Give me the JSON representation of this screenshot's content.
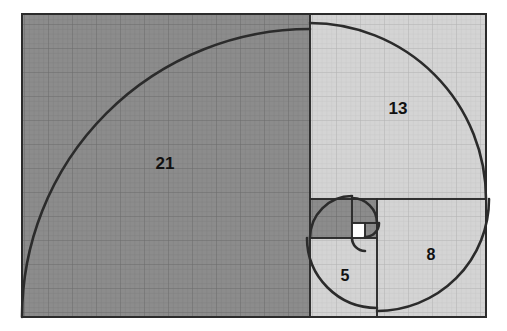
{
  "figure": {
    "kind": "fibonacci-spiral-diagram",
    "background_color": "#ffffff",
    "canvas": {
      "width": 507,
      "height": 331
    },
    "bounds": {
      "x": 22,
      "y": 14,
      "width": 464,
      "height": 303
    },
    "stroke_color": "#2b2b2b",
    "grid_color_dark": "#6f6f6f",
    "grid_color_light": "#b9b9b9",
    "fill_dark": "#8c8c8c",
    "fill_light": "#d4d4d4",
    "fill_white": "#ffffff",
    "border_color": "#2b2b2b",
    "spiral_stroke_width": 2.6,
    "square_stroke_width": 1.6
  },
  "chart_data": {
    "type": "diagram",
    "sequence": [
      1,
      1,
      2,
      3,
      5,
      8,
      13,
      21
    ],
    "labels_shown": [
      "21",
      "13",
      "8",
      "5"
    ],
    "squares": [
      {
        "value": 21,
        "label": "21",
        "label_visible": true,
        "shade": "dark",
        "fill": "#8c8c8c",
        "x": 22,
        "y": 14,
        "size_w": 288,
        "size_h": 303,
        "label_x": 165,
        "label_y": 165,
        "arc": {
          "cx": 310,
          "cy": 317,
          "r": 288,
          "start_deg": 180,
          "sweep_deg": 90
        }
      },
      {
        "value": 13,
        "label": "13",
        "label_visible": true,
        "shade": "light",
        "fill": "#d4d4d4",
        "x": 310,
        "y": 14,
        "size_w": 176,
        "size_h": 185,
        "label_x": 398,
        "label_y": 110,
        "arc": {
          "cx": 310,
          "cy": 199,
          "r": 176,
          "start_deg": 270,
          "sweep_deg": 90
        }
      },
      {
        "value": 8,
        "label": "8",
        "label_visible": true,
        "shade": "light",
        "fill": "#d4d4d4",
        "x": 377,
        "y": 199,
        "size_w": 109,
        "size_h": 118,
        "label_x": 431,
        "label_y": 256,
        "arc": {
          "cx": 377,
          "cy": 199,
          "r": 112,
          "start_deg": 0,
          "sweep_deg": 90
        }
      },
      {
        "value": 5,
        "label": "5",
        "label_visible": true,
        "shade": "light",
        "fill": "#d4d4d4",
        "x": 310,
        "y": 238,
        "size_w": 67,
        "size_h": 79,
        "label_x": 345,
        "label_y": 277,
        "arc": {
          "cx": 377,
          "cy": 238,
          "r": 70,
          "start_deg": 90,
          "sweep_deg": 90
        }
      },
      {
        "value": 3,
        "label": "3",
        "label_visible": false,
        "shade": "dark",
        "fill": "#8c8c8c",
        "x": 310,
        "y": 199,
        "size_w": 42,
        "size_h": 39,
        "label_x": 331,
        "label_y": 219,
        "arc": {
          "cx": 352,
          "cy": 238,
          "r": 42,
          "start_deg": 180,
          "sweep_deg": 90
        }
      },
      {
        "value": 2,
        "label": "2",
        "label_visible": false,
        "shade": "dark",
        "fill": "#8c8c8c",
        "x": 352,
        "y": 199,
        "size_w": 25,
        "size_h": 24,
        "label_x": 364,
        "label_y": 211,
        "arc": {
          "cx": 352,
          "cy": 223,
          "r": 25,
          "start_deg": 270,
          "sweep_deg": 90
        }
      },
      {
        "value": 1,
        "label": "1",
        "label_visible": false,
        "shade": "dark",
        "fill": "#8c8c8c",
        "x": 365,
        "y": 223,
        "size_w": 12,
        "size_h": 15,
        "label_x": 371,
        "label_y": 230,
        "arc": {
          "cx": 365,
          "cy": 223,
          "r": 14,
          "start_deg": 0,
          "sweep_deg": 90
        }
      },
      {
        "value": 1,
        "label": "1",
        "label_visible": false,
        "shade": "white",
        "fill": "#ffffff",
        "x": 352,
        "y": 223,
        "size_w": 13,
        "size_h": 15,
        "label_x": 358,
        "label_y": 230,
        "arc": {
          "cx": 365,
          "cy": 238,
          "r": 13,
          "start_deg": 90,
          "sweep_deg": 90
        }
      }
    ]
  }
}
